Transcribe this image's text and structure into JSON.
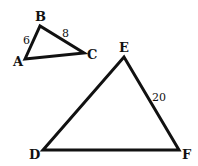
{
  "diagram": {
    "type": "similar-triangles",
    "stroke_color": "#111111",
    "triangles": [
      {
        "name": "ABC",
        "vertices": {
          "A": {
            "label": "A",
            "x": 25,
            "y": 59
          },
          "B": {
            "label": "B",
            "x": 40,
            "y": 26
          },
          "C": {
            "label": "C",
            "x": 84,
            "y": 53
          }
        },
        "side_labels": {
          "AB": "6",
          "BC": "8"
        }
      },
      {
        "name": "DEF",
        "vertices": {
          "D": {
            "label": "D",
            "x": 43,
            "y": 150
          },
          "E": {
            "label": "E",
            "x": 124,
            "y": 57
          },
          "F": {
            "label": "F",
            "x": 179,
            "y": 150
          }
        },
        "side_labels": {
          "EF": "20"
        }
      }
    ]
  }
}
